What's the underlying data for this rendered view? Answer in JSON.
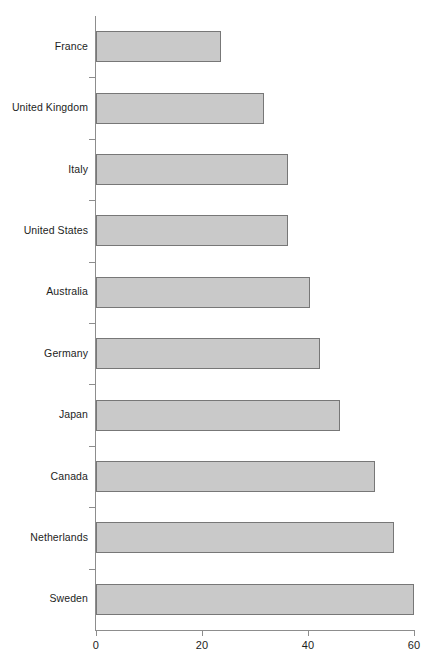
{
  "chart_data": {
    "type": "bar",
    "orientation": "horizontal",
    "title": "",
    "subtitle": "",
    "xlabel": "",
    "ylabel": "",
    "xlim": [
      0,
      60
    ],
    "ylim": null,
    "grid": false,
    "legend": null,
    "legend_position": "none",
    "xticks": [
      "0",
      "20",
      "40",
      "60"
    ],
    "xtick_values": [
      0,
      20,
      40,
      60
    ],
    "categories": [
      "France",
      "United Kingdom",
      "Italy",
      "United States",
      "Australia",
      "Germany",
      "Japan",
      "Canada",
      "Netherlands",
      "Sweden"
    ],
    "values": [
      23.5,
      31.7,
      36.2,
      36.2,
      40.4,
      42.3,
      46.0,
      52.6,
      56.2,
      60.0
    ],
    "series": [
      {
        "name": "",
        "values": [
          23.5,
          31.7,
          36.2,
          36.2,
          40.4,
          42.3,
          46.0,
          52.6,
          56.2,
          60.0
        ]
      }
    ],
    "annotations": []
  },
  "style": {
    "bar_fill": "#c9c9c9",
    "bar_border": "#777777",
    "axis_color": "#8d8d8d",
    "text_color": "#1d1d1d",
    "background": "#ffffff"
  }
}
